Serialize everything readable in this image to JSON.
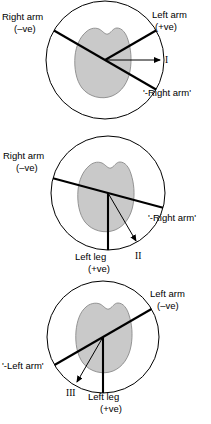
{
  "figure": {
    "colors": {
      "heart_fill": "#c9c9c9",
      "heart_stroke": "#8a8a8a",
      "line": "#000000",
      "background": "#ffffff"
    }
  },
  "panels": [
    {
      "id": "lead-i",
      "lead_label": "I",
      "labels": {
        "top_left": "Right arm",
        "top_left_polarity": "(–ve)",
        "top_right": "Left arm",
        "top_right_polarity": "(+ve)",
        "lower_right": "'-Right arm'"
      },
      "axes": [
        {
          "name": "right-arm-axis",
          "angle_deg": 210,
          "polarity": "negative"
        },
        {
          "name": "left-arm-axis",
          "angle_deg": 330,
          "polarity": "positive"
        },
        {
          "name": "minus-right-arm-axis",
          "angle_deg": 30,
          "polarity": "reflected"
        }
      ],
      "lead_vector": {
        "name": "lead-i-vector",
        "angle_deg": 0,
        "direction": "right"
      }
    },
    {
      "id": "lead-ii",
      "lead_label": "II",
      "labels": {
        "top_left": "Right arm",
        "top_left_polarity": "(–ve)",
        "bottom_center": "Left leg",
        "bottom_center_polarity": "(+ve)",
        "lower_right": "'-Right arm'"
      },
      "axes": [
        {
          "name": "right-arm-axis",
          "angle_deg": 195,
          "polarity": "negative"
        },
        {
          "name": "minus-right-arm-axis",
          "angle_deg": 15,
          "polarity": "reflected"
        },
        {
          "name": "left-leg-axis",
          "angle_deg": 90,
          "polarity": "positive"
        }
      ],
      "lead_vector": {
        "name": "lead-ii-vector",
        "angle_deg": 60,
        "direction": "down-right"
      }
    },
    {
      "id": "lead-iii",
      "lead_label": "III",
      "labels": {
        "top_right": "Left arm",
        "top_right_polarity": "(–ve)",
        "lower_left": "'-Left arm'",
        "bottom_center": "Left leg",
        "bottom_center_polarity": "(+ve)"
      },
      "axes": [
        {
          "name": "left-arm-axis",
          "angle_deg": 330,
          "polarity": "negative"
        },
        {
          "name": "minus-left-arm-axis",
          "angle_deg": 150,
          "polarity": "reflected"
        },
        {
          "name": "left-leg-axis",
          "angle_deg": 90,
          "polarity": "positive"
        }
      ],
      "lead_vector": {
        "name": "lead-iii-vector",
        "angle_deg": 120,
        "direction": "down-left"
      }
    }
  ]
}
